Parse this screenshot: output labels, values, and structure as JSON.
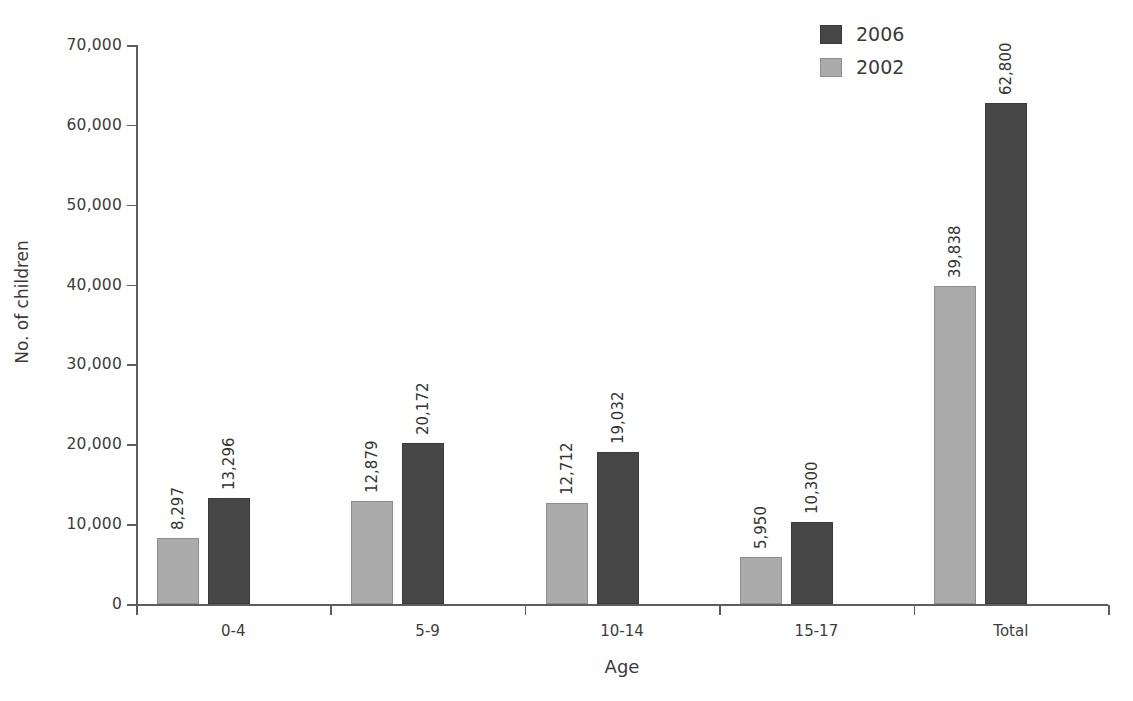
{
  "chart_data": {
    "type": "bar",
    "title": "",
    "xlabel": "Age",
    "ylabel": "No. of children",
    "categories": [
      "0-4",
      "5-9",
      "10-14",
      "15-17",
      "Total"
    ],
    "series": [
      {
        "name": "2002",
        "color": "#ababab",
        "values": [
          8297,
          12879,
          12712,
          5950,
          39838
        ],
        "value_labels": [
          "8,297",
          "12,879",
          "12,712",
          "5,950",
          "39,838"
        ]
      },
      {
        "name": "2006",
        "color": "#474747",
        "values": [
          13296,
          20172,
          19032,
          10300,
          62800
        ],
        "value_labels": [
          "13,296",
          "20,172",
          "19,032",
          "10,300",
          "62,800"
        ]
      }
    ],
    "ylim": [
      0,
      70000
    ],
    "ytick_values": [
      0,
      10000,
      20000,
      30000,
      40000,
      50000,
      60000,
      70000
    ],
    "ytick_labels": [
      "0",
      "10,000",
      "20,000",
      "30,000",
      "40,000",
      "50,000",
      "60,000",
      "70,000"
    ],
    "grid": false,
    "legend_position": "top-right",
    "legend_entries": [
      {
        "label": "2006",
        "color": "#474747"
      },
      {
        "label": "2002",
        "color": "#ababab"
      }
    ],
    "bar_order_in_group": [
      "2002",
      "2006"
    ]
  }
}
